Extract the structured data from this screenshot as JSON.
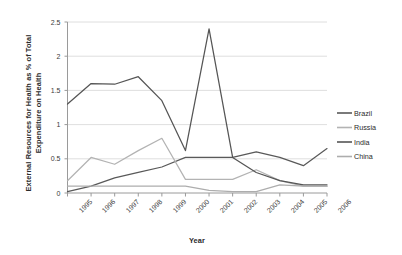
{
  "chart_data": {
    "type": "line",
    "title": "",
    "xlabel": "Year",
    "ylabel": "External Resources for Health as % of Total Expenditure on Health",
    "categories": [
      "1995",
      "1996",
      "1997",
      "1998",
      "1999",
      "2000",
      "2001",
      "2002",
      "2003",
      "2004",
      "2005",
      "2006"
    ],
    "x": [
      1995,
      1996,
      1997,
      1998,
      1999,
      2000,
      2001,
      2002,
      2003,
      2004,
      2005,
      2006
    ],
    "xlim": [
      1995,
      2006
    ],
    "ylim": [
      0,
      2.5
    ],
    "yticks": [
      "0",
      "0.5",
      "1",
      "1.5",
      "2",
      "2.5"
    ],
    "ytick_values": [
      0,
      0.5,
      1,
      1.5,
      2,
      2.5
    ],
    "grid": "horizontal",
    "legend_position": "right",
    "series": [
      {
        "name": "Brazil",
        "color": "#595959",
        "values": [
          0.02,
          0.1,
          0.22,
          0.3,
          0.38,
          0.52,
          0.52,
          0.52,
          0.6,
          0.52,
          0.4,
          0.65
        ]
      },
      {
        "name": "Russia",
        "color": "#b3b3b3",
        "values": [
          0.18,
          0.52,
          0.42,
          0.62,
          0.8,
          0.2,
          0.2,
          0.2,
          0.34,
          0.18,
          0.1,
          0.1
        ]
      },
      {
        "name": "India",
        "color": "#555555",
        "values": [
          1.3,
          1.6,
          1.59,
          1.7,
          1.35,
          0.62,
          2.4,
          0.52,
          0.3,
          0.18,
          0.12,
          0.12
        ]
      },
      {
        "name": "China",
        "color": "#adadad",
        "values": [
          0.1,
          0.1,
          0.1,
          0.1,
          0.1,
          0.1,
          0.04,
          0.02,
          0.02,
          0.12,
          0.1,
          0.1
        ]
      }
    ]
  },
  "legend": {
    "items": [
      {
        "label": "Brazil"
      },
      {
        "label": "Russia"
      },
      {
        "label": "India"
      },
      {
        "label": "China"
      }
    ]
  }
}
